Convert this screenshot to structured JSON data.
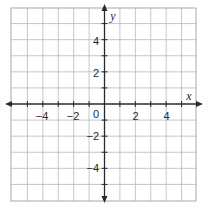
{
  "graph": {
    "x_axis_label": "x",
    "y_axis_label": "y",
    "x_range": [
      -6,
      6
    ],
    "y_range": [
      -6,
      6
    ],
    "grid_step": 1,
    "x_tick_labels": [
      {
        "value": -4,
        "text": "−4"
      },
      {
        "value": -2,
        "text": "−2"
      },
      {
        "value": 2,
        "text": "2"
      },
      {
        "value": 4,
        "text": "4"
      }
    ],
    "y_tick_labels": [
      {
        "value": 4,
        "text": "4"
      },
      {
        "value": 2,
        "text": "2"
      },
      {
        "value": -2,
        "text": "−2"
      },
      {
        "value": -4,
        "text": "−4"
      }
    ],
    "origin_label": "0",
    "colors": {
      "grid": "#b8b8b8",
      "border": "#a8a8a8",
      "axis": "#2a2a2a",
      "background": "#ffffff"
    }
  }
}
